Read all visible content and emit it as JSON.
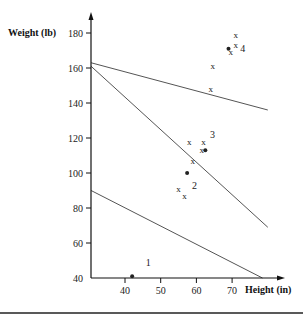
{
  "chart_data": {
    "type": "scatter",
    "title": "",
    "xlabel": "Height (in)",
    "ylabel": "Weight (lb)",
    "xlim": [
      30,
      80
    ],
    "ylim": [
      40,
      188
    ],
    "x_ticks": [
      40,
      50,
      60,
      70
    ],
    "y_ticks": [
      40,
      60,
      80,
      100,
      120,
      140,
      160,
      180
    ],
    "grid": false,
    "legend": null,
    "series": [
      {
        "name": "samples",
        "marker": "x",
        "points": [
          {
            "x": 71.0,
            "y": 179
          },
          {
            "x": 71.0,
            "y": 173
          },
          {
            "x": 69.6,
            "y": 169
          },
          {
            "x": 64.6,
            "y": 161
          },
          {
            "x": 64.0,
            "y": 148
          },
          {
            "x": 58.0,
            "y": 118
          },
          {
            "x": 62.0,
            "y": 118
          },
          {
            "x": 61.5,
            "y": 113
          },
          {
            "x": 59.0,
            "y": 107
          },
          {
            "x": 55.0,
            "y": 91
          },
          {
            "x": 56.7,
            "y": 87
          }
        ]
      },
      {
        "name": "cluster centers",
        "marker": "dot",
        "points": [
          {
            "x": 42.0,
            "y": 41,
            "label": "1"
          },
          {
            "x": 57.4,
            "y": 100,
            "label": "2"
          },
          {
            "x": 62.5,
            "y": 113,
            "label": "3"
          },
          {
            "x": 69.0,
            "y": 171,
            "label": "4"
          }
        ]
      }
    ],
    "lines": [
      {
        "name": "boundary-1-2",
        "from": {
          "x": 30.5,
          "y": 90
        },
        "to": {
          "x": 78.5,
          "y": 40
        }
      },
      {
        "name": "boundary-2-3",
        "from": {
          "x": 30.5,
          "y": 161
        },
        "to": {
          "x": 80,
          "y": 69
        }
      },
      {
        "name": "boundary-3-4",
        "from": {
          "x": 30.5,
          "y": 163
        },
        "to": {
          "x": 80,
          "y": 136
        }
      }
    ],
    "annotations": [
      {
        "text": "1",
        "x": 46.5,
        "y": 49
      },
      {
        "text": "2",
        "x": 59.5,
        "y": 93
      },
      {
        "text": "3",
        "x": 64.5,
        "y": 122
      },
      {
        "text": "4",
        "x": 73.0,
        "y": 171
      }
    ]
  },
  "axes": {
    "x_title": "Height (in)",
    "y_title": "Weight (lb)"
  }
}
